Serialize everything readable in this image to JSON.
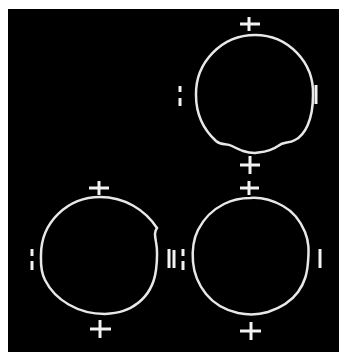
{
  "figure": {
    "background": "#000000",
    "stroke_color": "#e8e8e8",
    "caption": "",
    "panels": [
      {
        "id": "top-right",
        "ring": {
          "cx": 255,
          "cy": 95,
          "r": 60,
          "deformation": "bottom-wavy"
        },
        "marks": {
          "top": "+",
          "bottom": "+",
          "left": "=",
          "right": "|"
        }
      },
      {
        "id": "bottom-left",
        "ring": {
          "cx": 100,
          "cy": 255,
          "r": 59,
          "deformation": "right-wavy"
        },
        "marks": {
          "top": "+",
          "bottom": "+",
          "left": "=",
          "right": "|"
        }
      },
      {
        "id": "bottom-right",
        "ring": {
          "cx": 250,
          "cy": 255,
          "r": 58,
          "deformation": "all-wavy"
        },
        "marks": {
          "top": "+",
          "bottom": "+",
          "left": "=",
          "right": "|"
        }
      }
    ]
  }
}
